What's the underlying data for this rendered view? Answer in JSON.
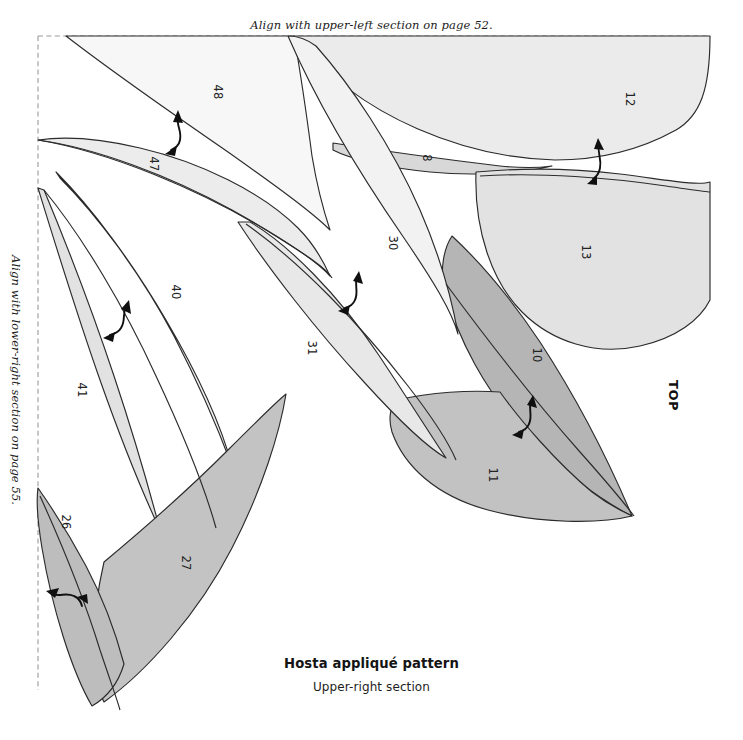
{
  "document": {
    "type": "applique-pattern-template",
    "title": "Hosta appliqué pattern",
    "subtitle": "Upper-right section",
    "orientation_marker": "TOP"
  },
  "align_notes": {
    "top": "Align with upper-left section on page 52.",
    "left": "Align with lower-right section on page 55."
  },
  "pieces": [
    {
      "number": "48",
      "shade": "#f7f7f7",
      "label_x": 214,
      "label_y": 92
    },
    {
      "number": "47",
      "shade": "#ececec",
      "label_x": 150,
      "label_y": 164
    },
    {
      "number": "12",
      "shade": "#ebebeb",
      "label_x": 626,
      "label_y": 99
    },
    {
      "number": "8",
      "shade": "#d8d8d8",
      "label_x": 423,
      "label_y": 158
    },
    {
      "number": "13",
      "shade": "#e2e2e2",
      "label_x": 582,
      "label_y": 252
    },
    {
      "number": "30",
      "shade": "#f2f2f2",
      "label_x": 389,
      "label_y": 243
    },
    {
      "number": "40",
      "shade": "#f0f0f0",
      "label_x": 172,
      "label_y": 292
    },
    {
      "number": "41",
      "shade": "#e2e2e2",
      "label_x": 78,
      "label_y": 390
    },
    {
      "number": "31",
      "shade": "#e8e8e8",
      "label_x": 308,
      "label_y": 348
    },
    {
      "number": "10",
      "shade": "#b5b5b5",
      "label_x": 533,
      "label_y": 355
    },
    {
      "number": "11",
      "shade": "#c2c2c2",
      "label_x": 489,
      "label_y": 475
    },
    {
      "number": "26",
      "shade": "#bdbdbd",
      "label_x": 62,
      "label_y": 522
    },
    {
      "number": "27",
      "shade": "#c3c3c3",
      "label_x": 182,
      "label_y": 563
    }
  ],
  "placement_arrows": [
    {
      "id": "arrow-47-48",
      "x": 175,
      "y": 132
    },
    {
      "id": "arrow-40-41",
      "x": 118,
      "y": 320
    },
    {
      "id": "arrow-30-31",
      "x": 352,
      "y": 292
    },
    {
      "id": "arrow-12-13",
      "x": 597,
      "y": 160
    },
    {
      "id": "arrow-10-11",
      "x": 527,
      "y": 416
    },
    {
      "id": "arrow-26-27",
      "x": 66,
      "y": 598
    }
  ],
  "colors": {
    "outline": "#2b2b2b",
    "registration_border": "#9a9a9a",
    "arrow": "#101010",
    "page_background": "#ffffff"
  },
  "registration_border": {
    "style": "dashed",
    "note": "trim / alignment guide on top and left edges"
  }
}
